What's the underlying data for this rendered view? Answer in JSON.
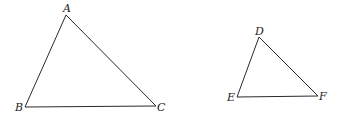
{
  "diagram": {
    "stroke_color": "#2a2a2a",
    "label_color": "#222222",
    "triangles": [
      {
        "name": "ABC",
        "vertices": [
          {
            "label": "A",
            "x": 66,
            "y": 15,
            "lx": 63,
            "ly": 12
          },
          {
            "label": "B",
            "x": 25,
            "y": 107,
            "lx": 15,
            "ly": 111
          },
          {
            "label": "C",
            "x": 156,
            "y": 106,
            "lx": 157,
            "ly": 111
          }
        ]
      },
      {
        "name": "DEF",
        "vertices": [
          {
            "label": "D",
            "x": 259,
            "y": 37,
            "lx": 255,
            "ly": 35
          },
          {
            "label": "E",
            "x": 237,
            "y": 97,
            "lx": 227,
            "ly": 101
          },
          {
            "label": "F",
            "x": 318,
            "y": 96,
            "lx": 319,
            "ly": 100
          }
        ]
      }
    ]
  }
}
